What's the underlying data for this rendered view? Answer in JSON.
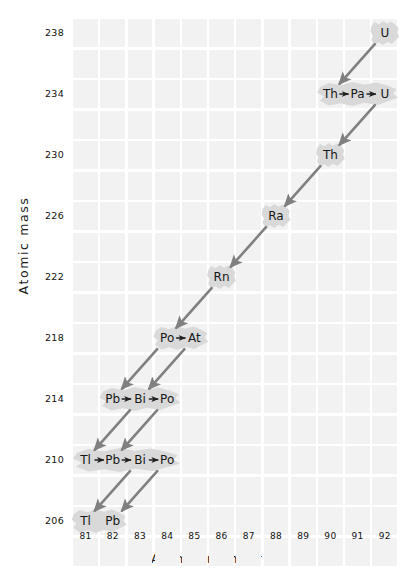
{
  "chart_data": {
    "type": "scatter",
    "title": "",
    "xlabel": "Atomic number",
    "ylabel": "Atomic mass",
    "xlim": [
      80.5,
      92.5
    ],
    "ylim": [
      204.5,
      239.5
    ],
    "xticks": [
      81,
      82,
      83,
      84,
      85,
      86,
      87,
      88,
      89,
      90,
      91,
      92
    ],
    "yticks": [
      238,
      234,
      230,
      226,
      222,
      218,
      214,
      210,
      206
    ],
    "grid": true,
    "legend": "none",
    "nodes": [
      {
        "label": "U",
        "z": 92,
        "mass": 238
      },
      {
        "label": "Th",
        "z": 90,
        "mass": 234
      },
      {
        "label": "Pa",
        "z": 91,
        "mass": 234
      },
      {
        "label": "U",
        "z": 92,
        "mass": 234
      },
      {
        "label": "Th",
        "z": 90,
        "mass": 230
      },
      {
        "label": "Ra",
        "z": 88,
        "mass": 226
      },
      {
        "label": "Rn",
        "z": 86,
        "mass": 222
      },
      {
        "label": "Po",
        "z": 84,
        "mass": 218
      },
      {
        "label": "At",
        "z": 85,
        "mass": 218
      },
      {
        "label": "Pb",
        "z": 82,
        "mass": 214
      },
      {
        "label": "Bi",
        "z": 83,
        "mass": 214
      },
      {
        "label": "Po",
        "z": 84,
        "mass": 214
      },
      {
        "label": "Tl",
        "z": 81,
        "mass": 210
      },
      {
        "label": "Pb",
        "z": 82,
        "mass": 210
      },
      {
        "label": "Bi",
        "z": 83,
        "mass": 210
      },
      {
        "label": "Po",
        "z": 84,
        "mass": 210
      },
      {
        "label": "Tl",
        "z": 81,
        "mass": 206
      },
      {
        "label": "Pb",
        "z": 82,
        "mass": 206
      }
    ],
    "transitions": [
      {
        "kind": "alpha",
        "from_z": 92,
        "from_mass": 238,
        "to_z": 90,
        "to_mass": 234
      },
      {
        "kind": "beta",
        "from_z": 90,
        "from_mass": 234,
        "to_z": 91,
        "to_mass": 234
      },
      {
        "kind": "beta",
        "from_z": 91,
        "from_mass": 234,
        "to_z": 92,
        "to_mass": 234
      },
      {
        "kind": "alpha",
        "from_z": 92,
        "from_mass": 234,
        "to_z": 90,
        "to_mass": 230
      },
      {
        "kind": "alpha",
        "from_z": 90,
        "from_mass": 230,
        "to_z": 88,
        "to_mass": 226
      },
      {
        "kind": "alpha",
        "from_z": 88,
        "from_mass": 226,
        "to_z": 86,
        "to_mass": 222
      },
      {
        "kind": "alpha",
        "from_z": 86,
        "from_mass": 222,
        "to_z": 84,
        "to_mass": 218
      },
      {
        "kind": "beta",
        "from_z": 84,
        "from_mass": 218,
        "to_z": 85,
        "to_mass": 218
      },
      {
        "kind": "alpha",
        "from_z": 84,
        "from_mass": 218,
        "to_z": 82,
        "to_mass": 214
      },
      {
        "kind": "alpha",
        "from_z": 85,
        "from_mass": 218,
        "to_z": 83,
        "to_mass": 214
      },
      {
        "kind": "beta",
        "from_z": 82,
        "from_mass": 214,
        "to_z": 83,
        "to_mass": 214
      },
      {
        "kind": "beta",
        "from_z": 83,
        "from_mass": 214,
        "to_z": 84,
        "to_mass": 214
      },
      {
        "kind": "alpha",
        "from_z": 83,
        "from_mass": 214,
        "to_z": 81,
        "to_mass": 210
      },
      {
        "kind": "alpha",
        "from_z": 84,
        "from_mass": 214,
        "to_z": 82,
        "to_mass": 210
      },
      {
        "kind": "beta",
        "from_z": 81,
        "from_mass": 210,
        "to_z": 82,
        "to_mass": 210
      },
      {
        "kind": "beta",
        "from_z": 82,
        "from_mass": 210,
        "to_z": 83,
        "to_mass": 210
      },
      {
        "kind": "beta",
        "from_z": 83,
        "from_mass": 210,
        "to_z": 84,
        "to_mass": 210
      },
      {
        "kind": "alpha",
        "from_z": 83,
        "from_mass": 210,
        "to_z": 81,
        "to_mass": 206
      },
      {
        "kind": "alpha",
        "from_z": 84,
        "from_mass": 210,
        "to_z": 82,
        "to_mass": 206
      }
    ],
    "groups": [
      {
        "mass": 238,
        "z_start": 92,
        "labels": [
          "U"
        ]
      },
      {
        "mass": 234,
        "z_start": 90,
        "labels": [
          "Th",
          "Pa",
          "U"
        ]
      },
      {
        "mass": 230,
        "z_start": 90,
        "labels": [
          "Th"
        ]
      },
      {
        "mass": 226,
        "z_start": 88,
        "labels": [
          "Ra"
        ]
      },
      {
        "mass": 222,
        "z_start": 86,
        "labels": [
          "Rn"
        ]
      },
      {
        "mass": 218,
        "z_start": 84,
        "labels": [
          "Po",
          "At"
        ]
      },
      {
        "mass": 214,
        "z_start": 82,
        "labels": [
          "Pb",
          "Bi",
          "Po"
        ]
      },
      {
        "mass": 210,
        "z_start": 81,
        "labels": [
          "Tl",
          "Pb",
          "Bi",
          "Po"
        ]
      },
      {
        "mass": 206,
        "z_start": 81,
        "labels": [
          "Tl",
          "Pb"
        ]
      }
    ],
    "colors": {
      "grid_cell": "#f2f2f2",
      "arrow": "#808080",
      "node_halo": "#d9d9d9",
      "text": "#171717",
      "background": "#ffffff"
    }
  }
}
